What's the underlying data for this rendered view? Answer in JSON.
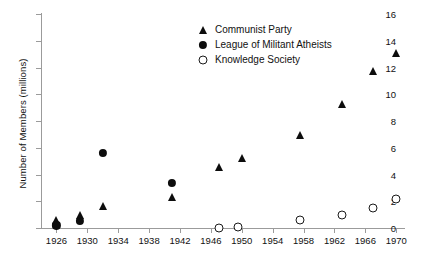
{
  "chart_data": {
    "type": "scatter",
    "title": "",
    "xlabel": "",
    "ylabel": "Number of Members (millions)",
    "xlim": [
      1924,
      1971
    ],
    "ylim": [
      0,
      16
    ],
    "grid": false,
    "legend_position": "top-center",
    "xticks": [
      1926,
      1930,
      1934,
      1938,
      1942,
      1946,
      1950,
      1954,
      1958,
      1962,
      1966,
      1970
    ],
    "yticks": [
      0,
      2,
      4,
      6,
      8,
      10,
      12,
      14,
      16
    ],
    "series": [
      {
        "name": "Communist Party",
        "marker": "filled-triangle",
        "color": "#0d0d0d",
        "points": [
          {
            "x": 1926,
            "y": 0.6
          },
          {
            "x": 1929,
            "y": 1.0
          },
          {
            "x": 1932,
            "y": 1.65
          },
          {
            "x": 1941,
            "y": 2.3
          },
          {
            "x": 1947,
            "y": 4.55
          },
          {
            "x": 1950,
            "y": 5.25
          },
          {
            "x": 1957.5,
            "y": 6.95
          },
          {
            "x": 1963,
            "y": 9.25
          },
          {
            "x": 1967,
            "y": 11.75
          },
          {
            "x": 1970,
            "y": 13.05
          }
        ]
      },
      {
        "name": "League of Militant Atheists",
        "marker": "filled-circle",
        "color": "#0d0d0d",
        "points": [
          {
            "x": 1926,
            "y": 0.2
          },
          {
            "x": 1929,
            "y": 0.55
          },
          {
            "x": 1932,
            "y": 5.6
          },
          {
            "x": 1941,
            "y": 3.4
          }
        ]
      },
      {
        "name": "Knowledge Society",
        "marker": "open-circle",
        "color": "#1a1a1a",
        "points": [
          {
            "x": 1947,
            "y": 0.0
          },
          {
            "x": 1949.5,
            "y": 0.05
          },
          {
            "x": 1957.5,
            "y": 0.6
          },
          {
            "x": 1963,
            "y": 1.0
          },
          {
            "x": 1967,
            "y": 1.5
          },
          {
            "x": 1970,
            "y": 2.15
          }
        ]
      }
    ]
  },
  "legend": {
    "items": [
      {
        "label": "Communist Party",
        "marker": "filled-triangle"
      },
      {
        "label": "League of Militant Atheists",
        "marker": "filled-circle"
      },
      {
        "label": "Knowledge Society",
        "marker": "open-circle"
      }
    ]
  },
  "colors": {
    "axis": "#9b9b9b",
    "marker": "#0d0d0d",
    "text": "#111111",
    "background": "#ffffff"
  }
}
